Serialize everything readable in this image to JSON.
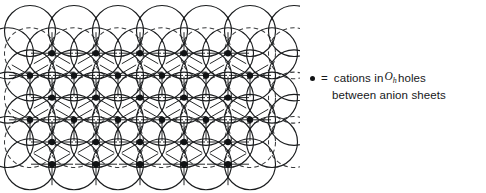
{
  "figure": {
    "kind": "crystal-lattice-diagram",
    "colors": {
      "background": "#ffffff",
      "circle_stroke": "#1a1c1e",
      "dashed_stroke": "#3a3c3e",
      "cation_fill": "#111315",
      "text": "#16181a"
    },
    "lattice": {
      "circle_radius": 25.5,
      "row_spacing": 22.2,
      "column_spacing": 44.0,
      "solid_rows": [
        {
          "y": 31.0,
          "x_start": 30.0,
          "count": 7,
          "offset": 0
        },
        {
          "y": 53.2,
          "x_start": 8.0,
          "count": 7,
          "offset": 1
        },
        {
          "y": 75.4,
          "x_start": 30.0,
          "count": 7,
          "offset": 0
        },
        {
          "y": 97.6,
          "x_start": 8.0,
          "count": 7,
          "offset": 1
        },
        {
          "y": 119.8,
          "x_start": 30.0,
          "count": 7,
          "offset": 0
        },
        {
          "y": 142.0,
          "x_start": 8.0,
          "count": 7,
          "offset": 1
        },
        {
          "y": 164.2,
          "x_start": 30.0,
          "count": 6,
          "offset": 0
        }
      ],
      "dashed_rows": [
        {
          "y": 53.2,
          "x_start": 30.0,
          "count": 7
        },
        {
          "y": 97.6,
          "x_start": 30.0,
          "count": 7
        },
        {
          "y": 142.0,
          "x_start": 30.0,
          "count": 7
        }
      ],
      "cation_rows": [
        {
          "y": 53.2,
          "x_start": 52.0,
          "count": 5
        },
        {
          "y": 75.4,
          "x_start": 30.0,
          "count": 6
        },
        {
          "y": 97.6,
          "x_start": 52.0,
          "count": 5
        },
        {
          "y": 119.8,
          "x_start": 30.0,
          "count": 6
        },
        {
          "y": 142.0,
          "x_start": 52.0,
          "count": 5
        },
        {
          "y": 164.2,
          "x_start": 52.0,
          "count": 5
        }
      ],
      "cation_dot_radius": 3.2,
      "spoke_length": 21.0
    }
  },
  "legend": {
    "bullet": "cation-dot",
    "equals": "=",
    "text_before": "cations in",
    "symbol": "O",
    "symbol_subscript": "h",
    "text_after": "holes",
    "line2": "between anion sheets",
    "full_text": "= cations in Oh holes between anion sheets"
  }
}
